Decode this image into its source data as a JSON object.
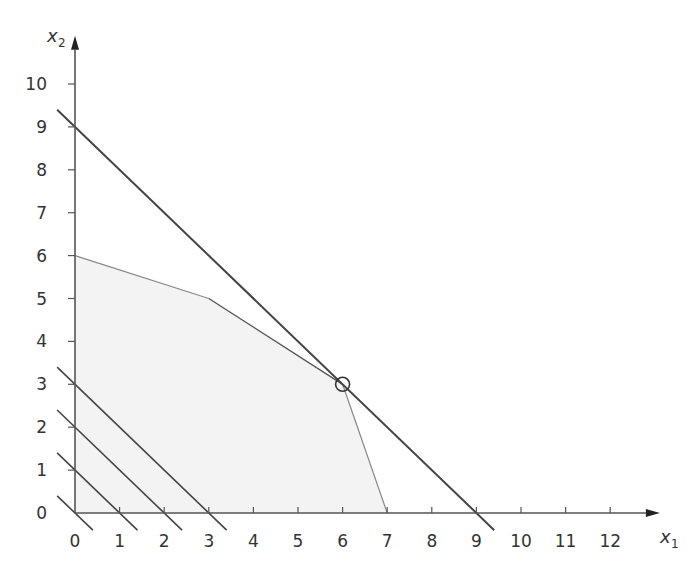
{
  "chart_data": {
    "type": "diagram",
    "title": "",
    "xlabel": "x1",
    "ylabel": "x2",
    "x_axis": {
      "label": "x",
      "subscript": "1",
      "ticks": [
        "0",
        "1",
        "2",
        "3",
        "4",
        "5",
        "6",
        "7",
        "8",
        "9",
        "10",
        "11",
        "12"
      ],
      "range": [
        0,
        12.8
      ]
    },
    "y_axis": {
      "label": "x",
      "subscript": "2",
      "ticks": [
        "0",
        "1",
        "2",
        "3",
        "4",
        "5",
        "6",
        "7",
        "8",
        "9",
        "10"
      ],
      "range": [
        0,
        10.8
      ]
    },
    "feasible_region": {
      "vertices": [
        [
          0,
          0
        ],
        [
          0,
          6
        ],
        [
          3,
          5
        ],
        [
          6,
          3
        ],
        [
          7,
          0
        ]
      ],
      "fill": "#f3f3f3"
    },
    "objective_lines": [
      {
        "equation": "x1 + x2 = 0",
        "value": 0
      },
      {
        "equation": "x1 + x2 = 1",
        "value": 1
      },
      {
        "equation": "x1 + x2 = 2",
        "value": 2
      },
      {
        "equation": "x1 + x2 = 3",
        "value": 3
      },
      {
        "equation": "x1 + x2 = 9",
        "value": 9
      }
    ],
    "optimal_point": {
      "x1": 6,
      "x2": 3,
      "marker": "circle"
    },
    "grid": false,
    "legend": null
  }
}
